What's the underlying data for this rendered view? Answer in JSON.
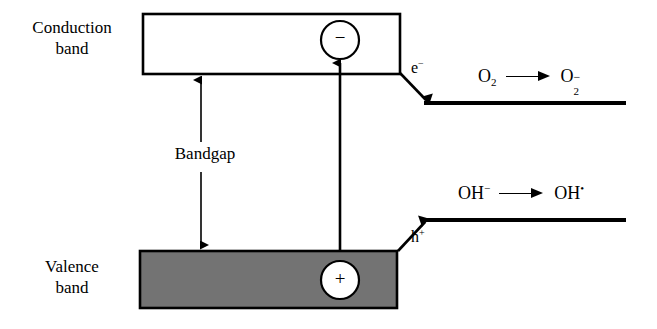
{
  "figure": {
    "background_color": "#ffffff",
    "stroke_color": "#000000",
    "valence_band_fill": "#737373"
  },
  "bands": {
    "conduction": {
      "label": "Conduction\nband",
      "fill": "#ffffff"
    },
    "valence": {
      "label": "Valence\nband",
      "fill": "#737373"
    },
    "gap": {
      "label": "Bandgap"
    }
  },
  "carriers": {
    "electron": {
      "symbol_charge": "−",
      "label_base": "e",
      "label_charge": "−"
    },
    "hole": {
      "symbol_charge": "+",
      "label_base": "h",
      "label_charge": "+"
    }
  },
  "reactions": {
    "reduction": {
      "reactant_base": "O",
      "reactant_sub": "2",
      "arrow": "⟶",
      "product_base": "O",
      "product_sub": "2",
      "product_charge": "−"
    },
    "oxidation": {
      "reactant_base": "OH",
      "reactant_charge": "−",
      "arrow": "⟶",
      "product_base": "OH",
      "product_charge": "•"
    }
  }
}
